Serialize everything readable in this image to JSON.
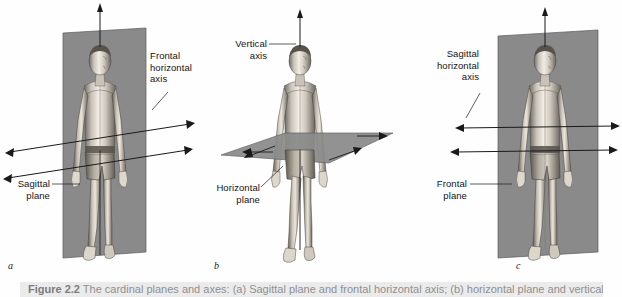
{
  "figure": {
    "panels": [
      {
        "id": "a",
        "letter": "a",
        "labels": [
          {
            "name": "frontal-horizontal-axis",
            "lines": [
              "Frontal",
              "horizontal",
              "axis"
            ]
          },
          {
            "name": "sagittal-plane",
            "lines": [
              "Sagittal",
              "plane"
            ]
          }
        ],
        "plane": "sagittal plane",
        "axis": "frontal horizontal axis"
      },
      {
        "id": "b",
        "letter": "b",
        "labels": [
          {
            "name": "vertical-axis",
            "lines": [
              "Vertical",
              "axis"
            ]
          },
          {
            "name": "horizontal-plane",
            "lines": [
              "Horizontal",
              "plane"
            ]
          }
        ],
        "plane": "horizontal plane",
        "axis": "vertical axis"
      },
      {
        "id": "c",
        "letter": "c",
        "labels": [
          {
            "name": "sagittal-horizontal-axis",
            "lines": [
              "Sagittal",
              "horizontal",
              "axis"
            ]
          },
          {
            "name": "frontal-plane",
            "lines": [
              "Frontal",
              "plane"
            ]
          }
        ],
        "plane": "frontal plane",
        "axis": "sagittal horizontal axis"
      }
    ],
    "label_text": {
      "frontal": "Frontal",
      "horizontal": "horizontal",
      "axis": "axis",
      "sagittal": "Sagittal",
      "plane": "plane",
      "vertical": "Vertical",
      "horizontal_cap": "Horizontal",
      "sagittal_cap": "Sagittal"
    },
    "caption": {
      "label": "Figure 2.2",
      "text": "The cardinal planes and axes: (a) Sagittal plane and frontal horizontal axis; (b) horizontal plane and vertical axis; (c) frontal plane and sagittal horizontal axis."
    },
    "colors": {
      "plane_fill": "#8a8a8a",
      "plane_edge": "#4d4d4d",
      "axis_line": "#1a1a1a",
      "label_text": "#141414",
      "background": "#ffffff",
      "caption_band": "#ebebeb"
    }
  }
}
